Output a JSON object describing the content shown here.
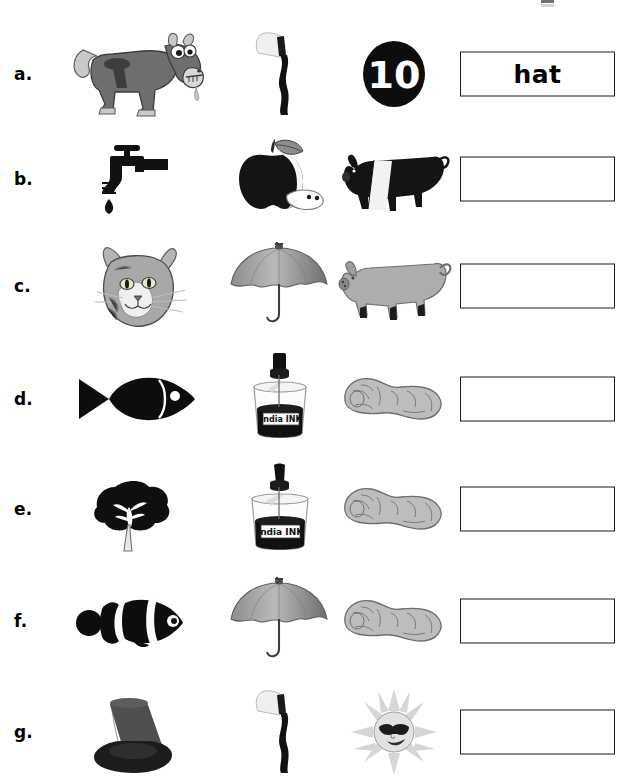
{
  "worksheet": {
    "type": "phonics-picture-blending",
    "header_fragment_visible": true,
    "columns": 3,
    "answer_placeholder": ""
  },
  "rows": [
    {
      "label": "a.",
      "pictures": [
        {
          "name": "horse",
          "alt": "cartoon grey horse"
        },
        {
          "name": "axe",
          "alt": "axe with curved handle"
        },
        {
          "name": "ten",
          "alt": "black circle with number 10",
          "text": "10"
        }
      ],
      "answer": "hat",
      "filled": true
    },
    {
      "label": "b.",
      "pictures": [
        {
          "name": "tap",
          "alt": "black water tap with drip"
        },
        {
          "name": "apple",
          "alt": "dark apple with slice"
        },
        {
          "name": "pig",
          "alt": "black and white belted pig"
        }
      ],
      "answer": "",
      "filled": false
    },
    {
      "label": "c.",
      "pictures": [
        {
          "name": "cat",
          "alt": "grey tabby cat face"
        },
        {
          "name": "umbrella",
          "alt": "open grey umbrella"
        },
        {
          "name": "pig",
          "alt": "grey pig standing"
        }
      ],
      "answer": "",
      "filled": false
    },
    {
      "label": "d.",
      "pictures": [
        {
          "name": "fish",
          "alt": "black fish silhouette"
        },
        {
          "name": "ink",
          "alt": "bottle of India INK",
          "text": "India INK"
        },
        {
          "name": "peanut",
          "alt": "peanut in shell"
        }
      ],
      "answer": "",
      "filled": false
    },
    {
      "label": "e.",
      "pictures": [
        {
          "name": "tree",
          "alt": "black leafy tree"
        },
        {
          "name": "ink",
          "alt": "bottle of India INK",
          "text": "India INK"
        },
        {
          "name": "peanut",
          "alt": "peanut in shell"
        }
      ],
      "answer": "",
      "filled": false
    },
    {
      "label": "f.",
      "pictures": [
        {
          "name": "fish",
          "alt": "black and white clownfish"
        },
        {
          "name": "umbrella",
          "alt": "open grey umbrella"
        },
        {
          "name": "peanut",
          "alt": "peanut in shell"
        }
      ],
      "answer": "",
      "filled": false
    },
    {
      "label": "g.",
      "pictures": [
        {
          "name": "hat",
          "alt": "black top hat"
        },
        {
          "name": "axe",
          "alt": "axe with curved handle"
        },
        {
          "name": "sun",
          "alt": "sun face wearing sunglasses"
        }
      ],
      "answer": "",
      "filled": false
    }
  ],
  "colors": {
    "ink": "#000000",
    "box_border": "#1a1a1a",
    "paper": "#ffffff",
    "grey_light": "#c9c9c9",
    "grey_mid": "#9a9a9a",
    "grey_dark": "#5d5d5d"
  }
}
